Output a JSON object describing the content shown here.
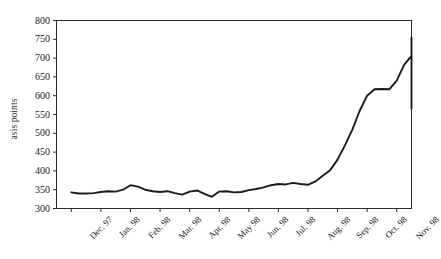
{
  "chart_data": {
    "type": "line",
    "title": "",
    "xlabel": "",
    "ylabel": "asis points",
    "ylim": [
      300,
      800
    ],
    "yticks": [
      300,
      350,
      400,
      450,
      500,
      550,
      600,
      650,
      700,
      750,
      800
    ],
    "grid": false,
    "legend": null,
    "categories": [
      "Dec. 97",
      "Jan. 98",
      "Feb. 98",
      "Mar. 98",
      "Apr. 98",
      "May 98",
      "Jun. 98",
      "Jul. 98",
      "Aug. 98",
      "Sep. 98",
      "Oct. 98",
      "Nov. 98"
    ],
    "series": [
      {
        "name": "spread",
        "color": "#1a1a1a",
        "x": [
          0,
          0.25,
          0.5,
          0.75,
          1,
          1.25,
          1.5,
          1.75,
          2,
          2.25,
          2.5,
          2.75,
          3,
          3.25,
          3.5,
          3.75,
          4,
          4.25,
          4.5,
          4.75,
          5,
          5.25,
          5.5,
          5.75,
          6,
          6.25,
          6.5,
          6.75,
          7,
          7.25,
          7.5,
          7.75,
          8,
          8.25,
          8.5,
          8.75,
          9,
          9.25,
          9.5,
          9.75,
          10,
          10.25,
          10.5,
          10.75,
          11,
          11.25,
          11.5,
          11.75
        ],
        "values": [
          343,
          340,
          340,
          341,
          344,
          346,
          345,
          350,
          362,
          358,
          350,
          346,
          344,
          346,
          341,
          337,
          345,
          348,
          339,
          331,
          345,
          346,
          343,
          344,
          349,
          352,
          356,
          362,
          365,
          364,
          368,
          365,
          363,
          372,
          387,
          402,
          430,
          468,
          510,
          560,
          600,
          617,
          618,
          617,
          640,
          682,
          706,
          755
        ],
        "values_tail": [
          734,
          700,
          693,
          670,
          648,
          626,
          612,
          596,
          575,
          566,
          582,
          590
        ]
      }
    ],
    "annotations": []
  },
  "axis": {
    "ytick_labels": [
      "800",
      "750",
      "700",
      "650",
      "600",
      "550",
      "500",
      "450",
      "400",
      "350",
      "300"
    ],
    "xtick_labels": [
      "Dec. 97",
      "Jan. 98",
      "Feb. 98",
      "Mar. 98",
      "Apr. 98",
      "May 98",
      "Jun. 98",
      "Jul. 98",
      "Aug. 98",
      "Sep. 98",
      "Oct. 98",
      "Nov. 98"
    ],
    "ylabel_text": "asis points"
  }
}
